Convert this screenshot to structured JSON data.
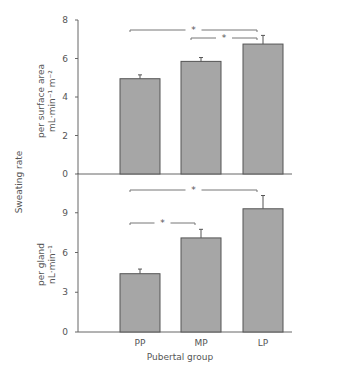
{
  "chart_data": [
    {
      "type": "bar",
      "title": "",
      "categories": [
        "PP",
        "MP",
        "LP"
      ],
      "values": [
        4.95,
        5.85,
        6.75
      ],
      "errors": [
        0.2,
        0.2,
        0.45
      ],
      "ylabel": "per surface area mL·min⁻¹ m⁻²",
      "ylabel_line1": "per surface area",
      "ylabel_line2": "mL·min⁻¹ m⁻²",
      "ylim": [
        0,
        8
      ],
      "yticks": [
        0,
        2,
        4,
        6,
        8
      ],
      "grid": false,
      "significance": [
        {
          "from": "PP",
          "to": "LP",
          "label": "*"
        },
        {
          "from": "MP",
          "to": "LP",
          "label": "*"
        }
      ]
    },
    {
      "type": "bar",
      "title": "",
      "categories": [
        "PP",
        "MP",
        "LP"
      ],
      "values": [
        4.4,
        7.1,
        9.3
      ],
      "errors": [
        0.35,
        0.65,
        1.0
      ],
      "ylabel": "per gland nL·min⁻¹",
      "ylabel_line1": "per gland",
      "ylabel_line2": "nL·min⁻¹",
      "ylim": [
        0,
        12
      ],
      "yticks": [
        0,
        3,
        6,
        9
      ],
      "xlabel": "Pubertal group",
      "grid": false,
      "significance": [
        {
          "from": "PP",
          "to": "LP",
          "label": "*"
        },
        {
          "from": "PP",
          "to": "MP",
          "label": "*"
        }
      ]
    }
  ],
  "shared_ylabel": "Sweating rate",
  "colors": {
    "bar": "#a6a6a6",
    "bar_edge": "#555555",
    "axis": "#666666"
  }
}
